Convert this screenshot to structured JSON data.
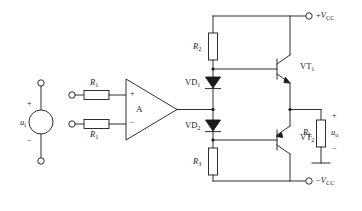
{
  "figure": {
    "type": "schematic-circuit-diagram",
    "background_color": "#ffffff",
    "line_color": "#1a1a1a"
  },
  "source": {
    "name": "input-voltage-source",
    "label": "u",
    "label_sub": "i",
    "plus_sign": "+",
    "minus_sign": "−",
    "shape": "circle"
  },
  "resistors": {
    "input_top": {
      "label": "R",
      "label_sub": "1"
    },
    "input_bottom": {
      "label": "R",
      "label_sub": "1"
    },
    "bias_top": {
      "label": "R",
      "label_sub": "2"
    },
    "bias_bottom": {
      "label": "R",
      "label_sub": "3"
    },
    "load": {
      "label": "R",
      "label_sub": "L"
    }
  },
  "opamp": {
    "name": "operational-amplifier",
    "label": "A",
    "noninverting_input_sign": "+",
    "inverting_input_sign": "−"
  },
  "diodes": {
    "upper": {
      "label": "VD",
      "label_sub": "1"
    },
    "lower": {
      "label": "VD",
      "label_sub": "2"
    }
  },
  "transistors": {
    "upper": {
      "label": "VT",
      "label_sub": "1",
      "type": "NPN"
    },
    "lower": {
      "label": "VT",
      "label_sub": "2",
      "type": "PNP"
    }
  },
  "rails": {
    "positive": {
      "sign": "+",
      "label": "V",
      "label_sub": "CC"
    },
    "negative": {
      "sign": "−",
      "label": "V",
      "label_sub": "CC"
    }
  },
  "output": {
    "label": "u",
    "label_sub": "o",
    "plus_sign": "+",
    "minus_sign": "−"
  },
  "terminals": {
    "source_top": "open-terminal",
    "source_bottom": "open-terminal",
    "input_top": "open-terminal",
    "input_bottom": "open-terminal",
    "rail_positive": "open-terminal",
    "rail_negative": "open-terminal"
  }
}
